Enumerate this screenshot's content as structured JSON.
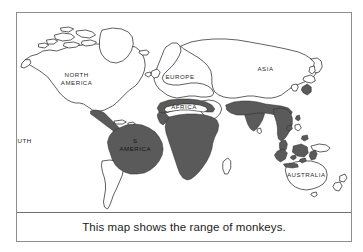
{
  "figure": {
    "caption": "This map shows the range of monkeys.",
    "border_color": "#8d8d8d",
    "background_color": "#ffffff"
  },
  "map": {
    "title_caption": "This map shows the range of monkeys.",
    "subject": "range of monkeys",
    "outline_color": "#1a1a1a",
    "range_fill_color": "#5a5a5a",
    "land_fill_color": "#ffffff",
    "labels": {
      "north_america": "NORTH\nAMERICA",
      "north_america_line1": "NORTH",
      "north_america_line2": "AMERICA",
      "south_america_line1": "SOUTH",
      "south_america_line2": "AMERICA",
      "europe": "EUROPE",
      "africa": "AFRICA",
      "asia": "ASIA",
      "australia": "AUSTRALIA"
    },
    "range_regions": [
      "Central America and southern Mexico",
      "Northern and central South America",
      "Sub-Saharan Africa",
      "Northern Africa band",
      "India and Southeast Asia",
      "Indonesian islands",
      "Southern Japan"
    ],
    "unshaded_regions": [
      "North America",
      "Greenland",
      "Europe",
      "Northern Asia",
      "Australia",
      "New Zealand",
      "Sahara"
    ]
  }
}
